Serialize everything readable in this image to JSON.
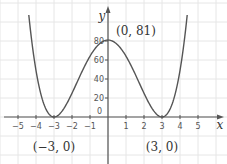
{
  "chart_data": {
    "type": "line",
    "title": "",
    "function": "y = (x^2 - 9)^2",
    "xlabel": "x",
    "ylabel": "y",
    "xlim": [
      -6,
      6.5
    ],
    "ylim": [
      -45,
      120
    ],
    "x_ticks": [
      -5,
      -4,
      -3,
      -2,
      -1,
      1,
      2,
      3,
      4,
      5
    ],
    "x_tick_labels": [
      "−5",
      "−4",
      "−3",
      "−2",
      "−1",
      "1",
      "2",
      "3",
      "4",
      "5"
    ],
    "y_ticks": [
      20,
      40,
      60,
      80
    ],
    "y_tick_labels": [
      "20",
      "40",
      "60",
      "80"
    ],
    "origin_label": "0",
    "grid": true,
    "series": [
      {
        "name": "curve",
        "color": "#555555",
        "x": [
          -4.4,
          -4.2,
          -4.0,
          -3.8,
          -3.6,
          -3.4,
          -3.2,
          -3.0,
          -2.8,
          -2.6,
          -2.4,
          -2.2,
          -2.0,
          -1.8,
          -1.6,
          -1.4,
          -1.2,
          -1.0,
          -0.8,
          -0.6,
          -0.4,
          -0.2,
          0.0,
          0.2,
          0.4,
          0.6,
          0.8,
          1.0,
          1.2,
          1.4,
          1.6,
          1.8,
          2.0,
          2.2,
          2.4,
          2.6,
          2.8,
          3.0,
          3.2,
          3.4,
          3.6,
          3.8,
          4.0,
          4.2,
          4.4
        ],
        "values": [
          107.86,
          75.69,
          49.0,
          29.47,
          15.68,
          6.45,
          1.54,
          0.0,
          2.02,
          5.02,
          10.37,
          17.2,
          25.0,
          33.18,
          41.47,
          49.46,
          56.86,
          64.0,
          69.89,
          74.17,
          77.5,
          80.28,
          81.0,
          80.28,
          77.5,
          74.17,
          69.89,
          64.0,
          56.86,
          49.46,
          41.47,
          33.18,
          25.0,
          17.2,
          10.37,
          5.02,
          2.02,
          0.0,
          1.54,
          6.45,
          15.68,
          29.47,
          49.0,
          75.69,
          107.86
        ]
      }
    ],
    "points": [
      {
        "x": 0,
        "y": 81,
        "label": "(0, 81)"
      },
      {
        "x": -3,
        "y": 0,
        "label": "(−3, 0)"
      },
      {
        "x": 3,
        "y": 0,
        "label": "(3, 0)"
      }
    ],
    "colors": {
      "grid": "#e6e6e6",
      "axis": "#555555",
      "curve": "#555555"
    }
  }
}
